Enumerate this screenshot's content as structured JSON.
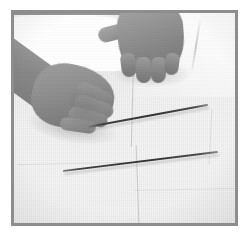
{
  "image": {
    "kind": "photograph",
    "color_mode": "grayscale",
    "width": 249,
    "height": 236,
    "caption": "Two hands laying a thin straight rod flat on a light cloth-covered surface beside a second rod",
    "alt_text": "Black and white photo: a person's two hands on a pale surface, the left hand pressing the end of a thin wire while a second thin wire lies parallel below"
  },
  "frame": {
    "outer_background": "#ffffff",
    "border_color": "#8d8d8d",
    "border_width_px": 3,
    "inset_left_px": 11,
    "inset_top_px": 10,
    "content_width_px": 227,
    "content_height_px": 216
  },
  "scene": {
    "background_label": "light cloth surface",
    "background_color": "#eeeeee",
    "highlight_color": "#ffffff",
    "shadow_color": "#8e8e8e",
    "objects": [
      {
        "name": "left-arm",
        "label": "Left forearm entering from the left edge",
        "tone": "#888888"
      },
      {
        "name": "left-hand",
        "label": "Left hand, palm down, fingers pointing lower-right, holding the end of the upper rod",
        "tone": "#909090"
      },
      {
        "name": "right-hand",
        "label": "Right hand seen from the back, fingers pointing down, resting on the surface",
        "tone": "#949494"
      },
      {
        "name": "upper-rod",
        "label": "Upper thin straight rod running from lower-left to upper-right",
        "tone": "#343434"
      },
      {
        "name": "lower-rod",
        "label": "Lower thin straight rod running parallel below the first",
        "tone": "#343434"
      },
      {
        "name": "garment",
        "label": "White garment / sleeve in the upper right corner",
        "tone": "#fbfbfb"
      },
      {
        "name": "paper-creases",
        "label": "Faint fold lines in the cloth",
        "tone": "#a8a8a8"
      }
    ]
  }
}
